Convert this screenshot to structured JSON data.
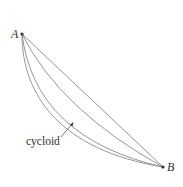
{
  "diagram": {
    "points": {
      "A": {
        "label": "A",
        "x": 22,
        "y": 34
      },
      "B": {
        "label": "B",
        "x": 163,
        "y": 167
      }
    },
    "curves": [
      {
        "name": "straight-line",
        "type": "line"
      },
      {
        "name": "arc-shallow",
        "type": "curve"
      },
      {
        "name": "arc-medium",
        "type": "curve"
      },
      {
        "name": "cycloid",
        "type": "curve"
      }
    ],
    "annotation": {
      "text": "cycloid",
      "target": "cycloid"
    },
    "colors": {
      "curve": "#8a8a8a",
      "text": "#333333"
    }
  }
}
